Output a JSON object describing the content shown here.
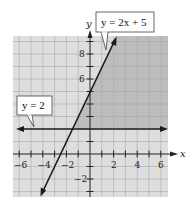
{
  "graph": {
    "axes": {
      "x_label": "x",
      "y_label": "y"
    },
    "x_ticks": [
      {
        "value": -6,
        "label": "−6"
      },
      {
        "value": -4,
        "label": "−4"
      },
      {
        "value": -2,
        "label": "−2"
      },
      {
        "value": 2,
        "label": "2"
      },
      {
        "value": 4,
        "label": "4"
      },
      {
        "value": 6,
        "label": "6"
      }
    ],
    "y_ticks": [
      {
        "value": 8,
        "label": "8"
      },
      {
        "value": 6,
        "label": "6"
      },
      {
        "value": -2,
        "label": "−2"
      }
    ],
    "lines": [
      {
        "name": "line-y-2x-5",
        "equation": "y = 2x + 5"
      },
      {
        "name": "line-y-2",
        "equation": "y = 2"
      }
    ],
    "callouts": {
      "line1": "y = 2x + 5",
      "line2": "y = 2"
    },
    "colors": {
      "light_shade": "#d9d9d9",
      "dark_shade": "#b5b5b5",
      "grid": "#a8a8a8",
      "line": "#1a1a1a"
    }
  }
}
